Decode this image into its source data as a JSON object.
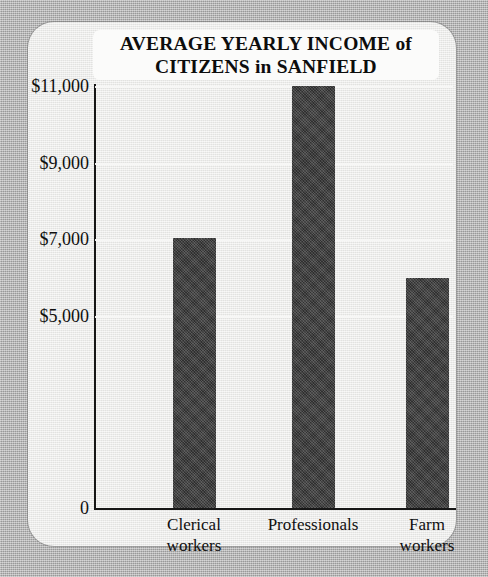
{
  "chart_data": {
    "type": "bar",
    "title": "AVERAGE YEARLY INCOME of\nCITIZENS in SANFIELD",
    "title_line1": "AVERAGE YEARLY INCOME of",
    "title_line2": "CITIZENS in SANFIELD",
    "xlabel": "",
    "ylabel": "",
    "categories": [
      "Clerical\nworkers",
      "Professionals",
      "Farm\nworkers"
    ],
    "category_labels": [
      "Clerical workers",
      "Professionals",
      "Farm workers"
    ],
    "values": [
      7050,
      11000,
      6000
    ],
    "ylim": [
      0,
      11600
    ],
    "ytick_values": [
      0,
      5000,
      7000,
      9000,
      11000
    ],
    "ytick_labels": [
      "0",
      "$5,000",
      "$7,000",
      "$9,000",
      "$11,000"
    ],
    "grid": true,
    "gridlines_at": [
      5000,
      7000,
      9000,
      11000
    ],
    "legend": null,
    "bar_color": "#3c3c3c",
    "plot_background": "#e9e9e7",
    "page_background": "#b3b3b3",
    "title_background": "#fbfbfa",
    "axis_color": "#161616",
    "gridline_color": "#f7f7f6"
  }
}
